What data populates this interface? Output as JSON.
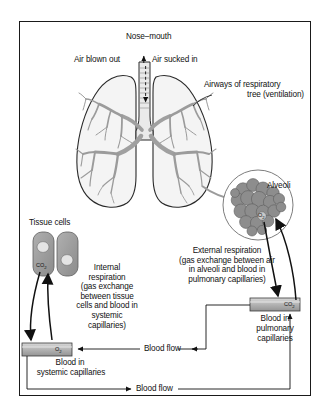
{
  "figure": {
    "type": "respiration-diagram",
    "title_label": "Nose–mouth",
    "background_color": "#ffffff",
    "frame_color": "#1a1a1a"
  },
  "labels": {
    "nose_mouth": "Nose–mouth",
    "air_blown_out": "Air blown out",
    "air_sucked_in": "Air sucked in",
    "airways_line1": "Airways of respiratory",
    "airways_line2": "tree (ventilation)",
    "alveoli": "Alveoli",
    "tissue_cells": "Tissue cells",
    "external_respiration": "External respiration\n(gas exchange between air\nin alveoli and blood in\npulmonary capillaries)",
    "internal_respiration": "Internal\nrespiration\n(gas exchange\nbetween tissue\ncells and blood in\nsystemic\ncapillaries)",
    "blood_pulmonary_line1": "Blood in",
    "blood_pulmonary_line2": "pulmonary",
    "blood_pulmonary_line3": "capillaries",
    "blood_systemic_line1": "Blood in",
    "blood_systemic_line2": "systemic capillaries",
    "blood_flow_upper": "Blood flow",
    "blood_flow_lower": "Blood flow"
  },
  "gas_labels": {
    "co2_tissue": "CO",
    "co2_tissue_sub": "2",
    "o2_alveoli": "O",
    "o2_alveoli_sub": "2",
    "co2_pulmonary": "CO",
    "co2_pulmonary_sub": "2",
    "o2_systemic": "O",
    "o2_systemic_sub": "2"
  },
  "colors": {
    "ink": "#111111",
    "frame": "#1a1a1a",
    "lung_fill": "#f2f2f2",
    "bronchi_fill": "#a8a8a8",
    "alveoli_fill": "#8f8f8f",
    "cell_fill": "#9a9a9a",
    "nucleus_fill": "#e2e2e2",
    "capillary_fill": "#b5b5b5"
  }
}
